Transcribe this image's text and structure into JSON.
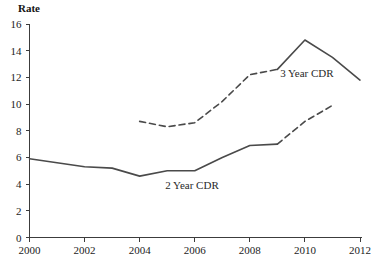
{
  "chart_data": {
    "type": "line",
    "title": "",
    "ylabel": "Rate",
    "xlabel": "",
    "xlim": [
      2000,
      2012
    ],
    "ylim": [
      0,
      16
    ],
    "grid": false,
    "legend_position": "inline-annotation",
    "x_ticks": [
      "2000",
      "2002",
      "2004",
      "2006",
      "2008",
      "2010",
      "2012"
    ],
    "x_tick_values": [
      2000,
      2002,
      2004,
      2006,
      2008,
      2010,
      2012
    ],
    "y_ticks": [
      "0",
      "2",
      "4",
      "6",
      "8",
      "10",
      "12",
      "14",
      "16"
    ],
    "y_tick_values": [
      0,
      2,
      4,
      6,
      8,
      10,
      12,
      14,
      16
    ],
    "series": [
      {
        "name": "2 Year CDR",
        "label": "2 Year CDR",
        "color": "#4a4a4a",
        "x": [
          2000,
          2001,
          2002,
          2003,
          2004,
          2005,
          2006,
          2007,
          2008,
          2009,
          2010,
          2011
        ],
        "values": [
          5.9,
          5.6,
          5.3,
          5.2,
          4.6,
          5.0,
          5.0,
          6.0,
          6.9,
          7.0,
          8.7,
          9.9
        ],
        "solid_until": 2009,
        "style_solid": "2000-2009",
        "style_dashed": "2009-2011",
        "label_x": 2005.9,
        "label_y": 3.6
      },
      {
        "name": "3 Year CDR",
        "label": "3 Year CDR",
        "color": "#3c3c3c",
        "x": [
          2004,
          2005,
          2006,
          2007,
          2008,
          2009,
          2010,
          2011,
          2012
        ],
        "values": [
          8.7,
          8.3,
          8.6,
          10.2,
          12.2,
          12.6,
          14.8,
          13.5,
          11.8
        ],
        "solid_from": 2009,
        "style_dashed": "2004-2009",
        "style_solid": "2009-2012",
        "label_x": 2009.1,
        "label_y": 12.0
      }
    ]
  },
  "axis": {
    "y_title": "Rate"
  },
  "labels": {
    "series_2year": "2 Year CDR",
    "series_3year": "3 Year CDR"
  },
  "ticks": {
    "y": [
      "16",
      "14",
      "12",
      "10",
      "8",
      "6",
      "4",
      "2",
      "0"
    ],
    "x": [
      "2000",
      "2002",
      "2004",
      "2006",
      "2008",
      "2010",
      "2012"
    ]
  },
  "colors": {
    "line": "#4a4a4a",
    "axis": "#3c3c3c",
    "text": "#1a1a1a",
    "background": "#ffffff"
  }
}
